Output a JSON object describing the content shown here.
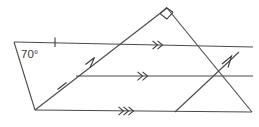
{
  "figure": {
    "stroke_color": "#4a4a4a",
    "marker_color": "#3c3c3c",
    "background": "#ffffff",
    "labels": {
      "angle_70": "70°"
    },
    "vertices": {
      "left_vertex": [
        14,
        42
      ],
      "bottom_left_vertex": [
        35,
        110
      ],
      "apex": [
        167,
        8
      ],
      "top_right_end": [
        253,
        47
      ],
      "bottom_right_end": [
        252,
        112
      ],
      "mid_left_start": [
        76,
        76
      ],
      "mid_right_end": [
        253,
        76
      ],
      "second_diagonal_base": [
        175,
        112
      ],
      "second_diagonal_tip": [
        239,
        52
      ],
      "crossing_point": [
        218,
        76
      ]
    },
    "segments": [
      {
        "name": "top-horizontal-line",
        "from": [
          14,
          42
        ],
        "to": [
          253,
          47
        ],
        "marks": "double-chevron"
      },
      {
        "name": "middle-horizontal-line",
        "from": [
          76,
          76
        ],
        "to": [
          253,
          76
        ],
        "marks": "double-chevron"
      },
      {
        "name": "bottom-horizontal-line",
        "from": [
          35,
          110
        ],
        "to": [
          252,
          112
        ],
        "marks": "double-chevron"
      },
      {
        "name": "left-slanted-side",
        "from": [
          14,
          42
        ],
        "to": [
          35,
          110
        ],
        "marks": "none"
      },
      {
        "name": "rising-diagonal",
        "from": [
          35,
          110
        ],
        "to": [
          167,
          8
        ],
        "marks": "single-arrow"
      },
      {
        "name": "triangle-right-leg",
        "from": [
          167,
          8
        ],
        "to": [
          252,
          112
        ],
        "marks": "none"
      },
      {
        "name": "second-rising-diagonal",
        "from": [
          175,
          112
        ],
        "to": [
          239,
          52
        ],
        "marks": "single-arrow"
      }
    ],
    "tick_marks": [
      {
        "name": "tick-on-top-line",
        "at": [
          55,
          42
        ]
      },
      {
        "name": "tick-on-diagonal",
        "at": [
          62,
          86
        ]
      }
    ],
    "right_angle": {
      "name": "right-angle-square",
      "at": [
        167,
        8
      ],
      "size": 9
    },
    "arrow_markers": [
      {
        "name": "chevron-top-line",
        "at": [
          158,
          45
        ],
        "type": "double"
      },
      {
        "name": "chevron-middle-line",
        "at": [
          143,
          76
        ],
        "type": "double"
      },
      {
        "name": "chevron-bottom-line",
        "at": [
          124,
          111
        ],
        "type": "double"
      },
      {
        "name": "arrow-rising-diagonal",
        "at": [
          92,
          64
        ],
        "type": "single"
      },
      {
        "name": "arrow-second-diagonal",
        "at": [
          228,
          63
        ],
        "type": "single"
      }
    ]
  }
}
